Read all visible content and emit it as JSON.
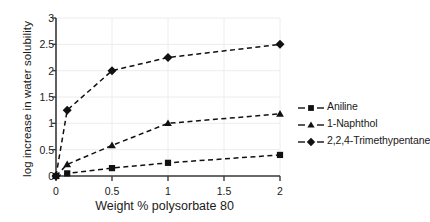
{
  "chart_data": {
    "type": "line",
    "title": "",
    "xlabel": "Weight % polysorbate 80",
    "ylabel": "log increase in water solubility",
    "x": [
      0,
      0.1,
      0.5,
      1,
      2
    ],
    "xlim": [
      0,
      2
    ],
    "ylim": [
      0,
      3
    ],
    "xticks": [
      "0",
      "0.5",
      "1",
      "1.5",
      "2"
    ],
    "xtick_values": [
      0,
      0.5,
      1,
      1.5,
      2
    ],
    "yticks": [
      "0",
      "0.5",
      "1",
      "1.5",
      "2",
      "2.5",
      "3"
    ],
    "ytick_values": [
      0,
      0.5,
      1,
      1.5,
      2,
      2.5,
      3
    ],
    "grid": true,
    "legend_position": "right",
    "linestyle": "dashed",
    "series": [
      {
        "name": "Aniline",
        "marker": "square",
        "color": "#111111",
        "values": [
          0,
          0.05,
          0.15,
          0.25,
          0.4
        ]
      },
      {
        "name": "1-Naphthol",
        "marker": "triangle",
        "color": "#111111",
        "values": [
          0,
          0.22,
          0.58,
          1.0,
          1.18
        ]
      },
      {
        "name": "2,2,4-Trimethypentane",
        "marker": "diamond",
        "color": "#111111",
        "values": [
          0,
          1.25,
          2.0,
          2.25,
          2.5
        ]
      }
    ]
  },
  "axis": {
    "line_color": "#3a3a3a",
    "grid_color": "#ececec"
  },
  "legend": {
    "entries": [
      {
        "label": "Aniline",
        "marker": "square-marker"
      },
      {
        "label": "1-Naphthol",
        "marker": "triangle-marker"
      },
      {
        "label": "2,2,4-Trimethypentane",
        "marker": "diamond-marker"
      }
    ]
  }
}
